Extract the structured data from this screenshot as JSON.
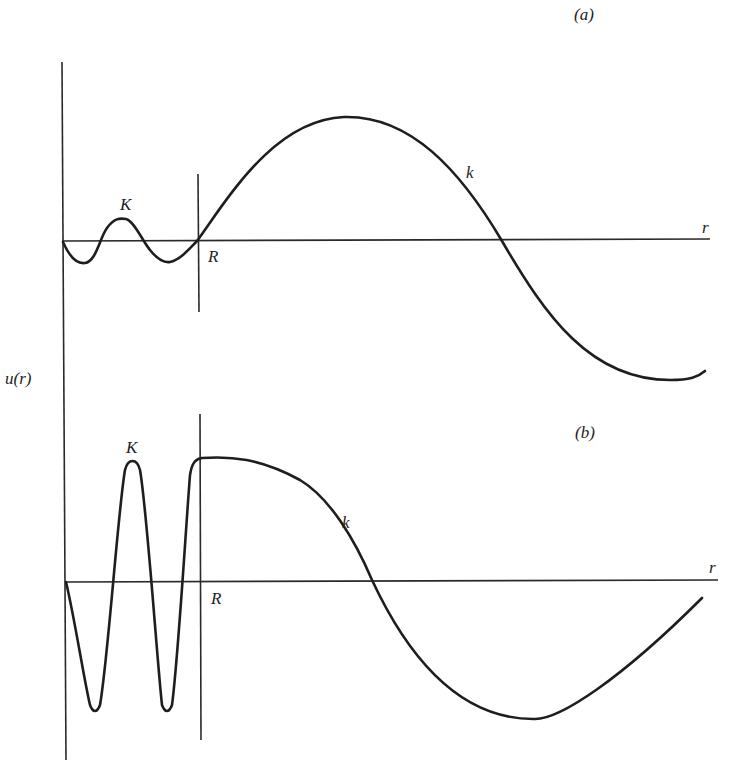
{
  "figure": {
    "y_axis_label": "u(r)",
    "panels": [
      {
        "id": "a",
        "tag": "(a)",
        "inner_label": "K",
        "boundary_label": "R",
        "outer_label": "k",
        "x_axis_label": "r"
      },
      {
        "id": "b",
        "tag": "(b)",
        "inner_label": "K",
        "boundary_label": "R",
        "outer_label": "k",
        "x_axis_label": "r"
      }
    ],
    "colors": {
      "background": "#ffffff",
      "line": "#1e1e1e",
      "text": "#222222"
    }
  }
}
